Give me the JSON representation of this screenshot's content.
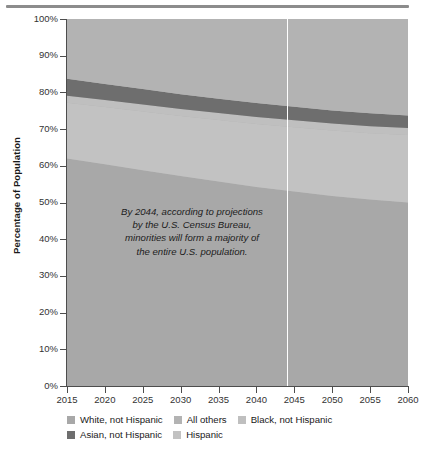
{
  "chart_data": {
    "type": "area",
    "title": "",
    "xlabel": "",
    "ylabel": "Percentage of Population",
    "x": [
      2015,
      2020,
      2025,
      2030,
      2035,
      2040,
      2045,
      2050,
      2055,
      2060
    ],
    "xlim": [
      2015,
      2060
    ],
    "ylim": [
      0,
      100
    ],
    "stacked": true,
    "stack_order_bottom_to_top": [
      "White, not Hispanic",
      "Hispanic",
      "Black, not Hispanic",
      "Asian, not Hispanic",
      "All others"
    ],
    "grid": false,
    "legend_position": "below",
    "tick_labels": {
      "x": [
        "2015",
        "2020",
        "2025",
        "2030",
        "2035",
        "2040",
        "2045",
        "2050",
        "2055",
        "2060"
      ],
      "y": [
        "0%",
        "10%",
        "20%",
        "30%",
        "40%",
        "50%",
        "60%",
        "70%",
        "80%",
        "90%",
        "100%"
      ]
    },
    "series": [
      {
        "name": "White, not Hispanic",
        "color": "#a8a8a8",
        "values": [
          62.0,
          60.4,
          58.8,
          57.2,
          55.7,
          54.2,
          53.0,
          51.8,
          50.8,
          50.0
        ],
        "cumulative_top": [
          62.0,
          60.4,
          58.8,
          57.2,
          55.7,
          54.2,
          53.0,
          51.8,
          50.8,
          50.0
        ]
      },
      {
        "name": "Hispanic",
        "color": "#c2c2c2",
        "values": [
          15.2,
          15.6,
          16.0,
          16.4,
          16.8,
          17.2,
          17.5,
          17.8,
          18.1,
          18.4
        ],
        "cumulative_top": [
          77.2,
          76.0,
          74.8,
          73.6,
          72.5,
          71.4,
          70.5,
          69.6,
          68.9,
          68.4
        ]
      },
      {
        "name": "Black, not Hispanic",
        "color": "#bfbfbf",
        "values": [
          1.9,
          1.9,
          1.9,
          1.9,
          1.9,
          1.9,
          1.9,
          1.9,
          1.9,
          1.9
        ],
        "cumulative_top": [
          79.1,
          77.9,
          76.7,
          75.5,
          74.4,
          73.3,
          72.4,
          71.5,
          70.8,
          70.3
        ]
      },
      {
        "name": "Asian, not Hispanic",
        "color": "#6e6e6e",
        "values": [
          4.6,
          4.4,
          4.2,
          4.0,
          3.9,
          3.8,
          3.7,
          3.6,
          3.5,
          3.4
        ],
        "cumulative_top": [
          83.7,
          82.3,
          80.9,
          79.5,
          78.3,
          77.1,
          76.1,
          75.1,
          74.3,
          73.7
        ]
      },
      {
        "name": "All others",
        "color": "#b3b3b3",
        "values": [
          16.3,
          17.7,
          19.1,
          20.5,
          21.7,
          22.9,
          23.9,
          24.9,
          25.7,
          26.3
        ],
        "cumulative_top": [
          100,
          100,
          100,
          100,
          100,
          100,
          100,
          100,
          100,
          100
        ]
      }
    ],
    "annotations": [
      {
        "name": "majority-minority-note",
        "text": "By 2044, according to projections by the U.S. Census Bureau, minorities will form a majority of the entire U.S. population.",
        "lines": [
          "By 2044, according to projections",
          "by the U.S. Census Bureau,",
          "minorities will form a majority of",
          "the entire U.S. population."
        ]
      }
    ],
    "marker_line": {
      "x": 2044,
      "color": "#ffffff",
      "label": ""
    }
  },
  "legend": {
    "rows": [
      [
        {
          "label": "White, not Hispanic",
          "color": "#a8a8a8"
        },
        {
          "label": "All others",
          "color": "#b3b3b3"
        },
        {
          "label": "Black, not Hispanic",
          "color": "#bfbfbf"
        }
      ],
      [
        {
          "label": "Asian, not Hispanic",
          "color": "#6e6e6e"
        },
        {
          "label": "Hispanic",
          "color": "#c2c2c2"
        }
      ]
    ]
  },
  "colors": {
    "plot_background": "#b3b3b3",
    "axis": "#4d4d4d",
    "text": "#1a1a1a",
    "marker": "#ffffff",
    "rule": "#8c8c8c"
  }
}
